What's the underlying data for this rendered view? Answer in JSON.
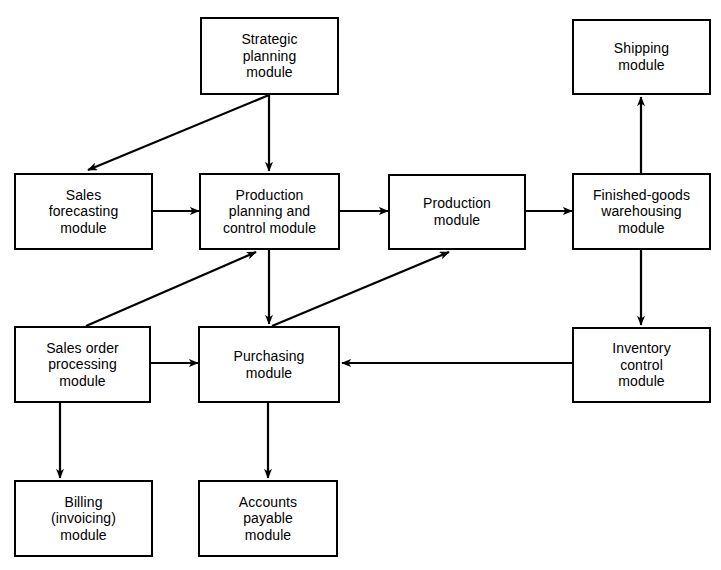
{
  "diagram": {
    "type": "flowchart",
    "canvas": {
      "width": 721,
      "height": 570
    },
    "style": {
      "background": "#ffffff",
      "stroke": "#000000",
      "box_fill": "#ffffff",
      "text_color": "#000000"
    },
    "nodes": [
      {
        "id": "strategic-planning",
        "lines": [
          "Strategic",
          "planning",
          "module"
        ],
        "x": 200,
        "y": 17,
        "w": 139,
        "h": 78
      },
      {
        "id": "shipping",
        "lines": [
          "Shipping",
          "module"
        ],
        "x": 572,
        "y": 19,
        "w": 139,
        "h": 76
      },
      {
        "id": "sales-forecasting",
        "lines": [
          "Sales",
          "forecasting",
          "module"
        ],
        "x": 14,
        "y": 173,
        "w": 139,
        "h": 77
      },
      {
        "id": "production-planning-and-control",
        "lines": [
          "Production",
          "planning and",
          "control  module"
        ],
        "x": 199,
        "y": 173,
        "w": 141,
        "h": 77
      },
      {
        "id": "production",
        "lines": [
          "Production",
          "module"
        ],
        "x": 388,
        "y": 174,
        "w": 138,
        "h": 76
      },
      {
        "id": "finished-goods-warehousing",
        "lines": [
          "Finished-goods",
          "warehousing",
          "module"
        ],
        "x": 572,
        "y": 173,
        "w": 139,
        "h": 77
      },
      {
        "id": "sales-order-processing",
        "lines": [
          "Sales order",
          "processing",
          "module"
        ],
        "x": 14,
        "y": 326,
        "w": 137,
        "h": 77
      },
      {
        "id": "purchasing",
        "lines": [
          "Purchasing",
          "module"
        ],
        "x": 198,
        "y": 326,
        "w": 142,
        "h": 77
      },
      {
        "id": "inventory-control",
        "lines": [
          "Inventory",
          "control",
          "module"
        ],
        "x": 572,
        "y": 327,
        "w": 139,
        "h": 76
      },
      {
        "id": "billing-invoicing",
        "lines": [
          "Billing",
          "(invoicing)",
          "module"
        ],
        "x": 14,
        "y": 480,
        "w": 139,
        "h": 77
      },
      {
        "id": "accounts-payable",
        "lines": [
          "Accounts",
          "payable",
          "module"
        ],
        "x": 198,
        "y": 480,
        "w": 140,
        "h": 77
      }
    ],
    "edges": [
      {
        "id": "strategic-to-sales-forecasting",
        "from": "strategic-planning",
        "to": "sales-forecasting",
        "kind": "diagonal"
      },
      {
        "id": "strategic-to-production-planning",
        "from": "strategic-planning",
        "to": "production-planning-and-control",
        "kind": "vertical"
      },
      {
        "id": "sales-forecasting-to-production-planning",
        "from": "sales-forecasting",
        "to": "production-planning-and-control",
        "kind": "horizontal"
      },
      {
        "id": "production-planning-to-production",
        "from": "production-planning-and-control",
        "to": "production",
        "kind": "horizontal"
      },
      {
        "id": "production-to-finished-goods",
        "from": "production",
        "to": "finished-goods-warehousing",
        "kind": "horizontal"
      },
      {
        "id": "finished-goods-to-shipping",
        "from": "finished-goods-warehousing",
        "to": "shipping",
        "kind": "vertical-up"
      },
      {
        "id": "finished-goods-to-inventory-control",
        "from": "finished-goods-warehousing",
        "to": "inventory-control",
        "kind": "vertical"
      },
      {
        "id": "inventory-control-to-purchasing",
        "from": "inventory-control",
        "to": "purchasing",
        "kind": "horizontal-left"
      },
      {
        "id": "production-planning-to-purchasing",
        "from": "production-planning-and-control",
        "to": "purchasing",
        "kind": "vertical"
      },
      {
        "id": "sales-order-to-production-planning",
        "from": "sales-order-processing",
        "to": "production-planning-and-control",
        "kind": "diagonal-up"
      },
      {
        "id": "purchasing-to-production",
        "from": "purchasing",
        "to": "production",
        "kind": "diagonal-up"
      },
      {
        "id": "sales-order-to-purchasing",
        "from": "sales-order-processing",
        "to": "purchasing",
        "kind": "horizontal"
      },
      {
        "id": "sales-order-to-billing",
        "from": "sales-order-processing",
        "to": "billing-invoicing",
        "kind": "vertical"
      },
      {
        "id": "purchasing-to-accounts-payable",
        "from": "purchasing",
        "to": "accounts-payable",
        "kind": "vertical"
      }
    ]
  }
}
